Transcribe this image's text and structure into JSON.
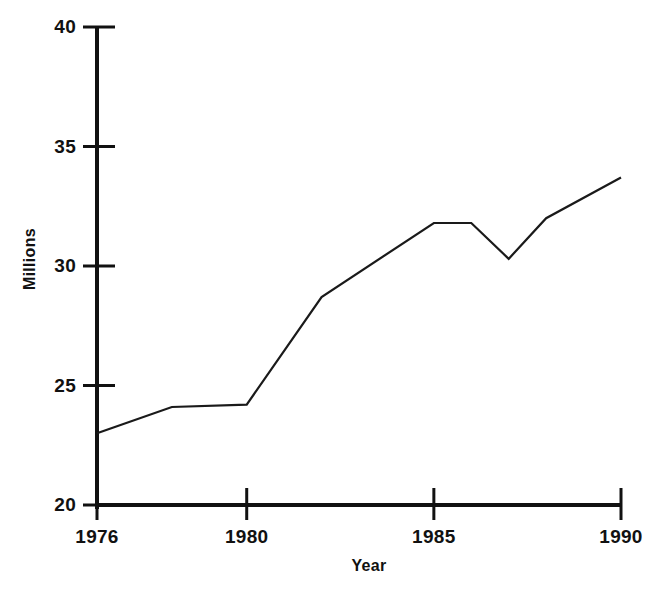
{
  "chart_data": {
    "type": "line",
    "title": "",
    "xlabel": "Year",
    "ylabel": "Millions",
    "xlim": [
      1976,
      1990
    ],
    "ylim": [
      20,
      40
    ],
    "xticks": [
      1976,
      1980,
      1985,
      1990
    ],
    "xtick_labels": [
      "1976",
      "1980",
      "1985",
      "1990"
    ],
    "yticks": [
      20,
      25,
      30,
      35,
      40
    ],
    "ytick_labels": [
      "20",
      "25",
      "30",
      "35",
      "40"
    ],
    "grid": false,
    "legend": null,
    "legend_position": "none",
    "line_color": "#1a1a1a",
    "line_width": 2.2,
    "markers": false,
    "x": [
      1976,
      1978,
      1980,
      1982,
      1985,
      1986,
      1987,
      1988,
      1990
    ],
    "values": [
      23.0,
      24.1,
      24.2,
      28.7,
      31.8,
      31.8,
      30.3,
      32.0,
      33.7
    ],
    "series": [
      {
        "name": "Millions",
        "x": [
          1976,
          1978,
          1980,
          1982,
          1985,
          1986,
          1987,
          1988,
          1990
        ],
        "values": [
          23.0,
          24.1,
          24.2,
          28.7,
          31.8,
          31.8,
          30.3,
          32.0,
          33.7
        ]
      }
    ],
    "annotations": []
  },
  "axes": {
    "y_axis_label": "Millions",
    "x_axis_label": "Year"
  }
}
